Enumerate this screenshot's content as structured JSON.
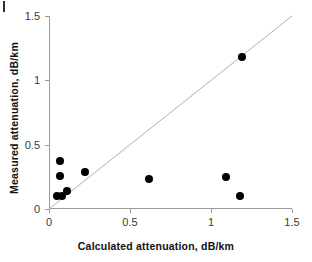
{
  "figure": {
    "background_color": "#ffffff",
    "marker_color": "#000000",
    "axis_color": "#9a9a9a",
    "line_color": "#b0b0b0",
    "corner_mark": ""
  },
  "chart_data": {
    "type": "scatter",
    "title": "",
    "xlabel": "Calculated attenuation, dB/km",
    "ylabel": "Measured attenuation, dB/km",
    "xlim": [
      0,
      1.5
    ],
    "ylim": [
      0,
      1.5
    ],
    "xticks": [
      0,
      0.5,
      1,
      1.5
    ],
    "yticks": [
      0,
      0.5,
      1,
      1.5
    ],
    "xtick_labels": [
      "0",
      "0.5",
      "1",
      "1.5"
    ],
    "ytick_labels": [
      "0",
      "0.5",
      "1",
      "1.5"
    ],
    "grid": false,
    "legend": null,
    "series": [
      {
        "name": "Measured vs calculated attenuation",
        "marker": "filled-circle",
        "color": "#000000",
        "points": [
          {
            "x": 0.05,
            "y": 0.1
          },
          {
            "x": 0.08,
            "y": 0.1
          },
          {
            "x": 0.11,
            "y": 0.14
          },
          {
            "x": 0.07,
            "y": 0.26
          },
          {
            "x": 0.07,
            "y": 0.37
          },
          {
            "x": 0.22,
            "y": 0.29
          },
          {
            "x": 0.62,
            "y": 0.23
          },
          {
            "x": 1.09,
            "y": 0.25
          },
          {
            "x": 1.18,
            "y": 0.1
          },
          {
            "x": 1.19,
            "y": 1.18
          }
        ]
      }
    ],
    "reference_line": {
      "name": "identity-line",
      "type": "line",
      "x": [
        0.0,
        1.5
      ],
      "y": [
        0.0,
        1.5
      ],
      "color": "#b0b0b0"
    }
  }
}
